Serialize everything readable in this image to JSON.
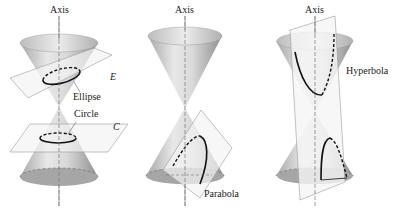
{
  "figure": {
    "panels": [
      {
        "id": "ellipse-circle",
        "axis_label": "Axis",
        "curves": [
          {
            "name": "Ellipse",
            "plane_label": "E"
          },
          {
            "name": "Circle",
            "plane_label": "C"
          }
        ]
      },
      {
        "id": "parabola",
        "axis_label": "Axis",
        "curves": [
          {
            "name": "Parabola"
          }
        ]
      },
      {
        "id": "hyperbola",
        "axis_label": "Axis",
        "curves": [
          {
            "name": "Hyperbola"
          }
        ]
      }
    ],
    "colors": {
      "cone_light": "#e6e6e6",
      "cone_dark": "#9a9a9a",
      "plane": "#f2f2f2",
      "plane_edge": "#9a9a9a",
      "curve": "#111111",
      "axis": "#777777"
    }
  }
}
